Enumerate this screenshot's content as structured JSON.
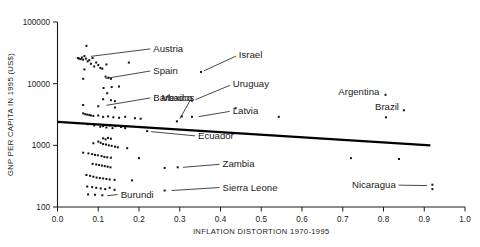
{
  "chart_data": {
    "type": "scatter",
    "title": "",
    "xlabel": "INFLATION DISTORTION 1970-1995",
    "ylabel": "GNP PER CAPITA IN 1995 (US$)",
    "yscale": "log",
    "xscale": "linear",
    "xlim": [
      0.0,
      1.0
    ],
    "ylim": [
      100,
      100000
    ],
    "grid": false,
    "legend": null,
    "xticks": [
      "0.0",
      "0.1",
      "0.2",
      "0.3",
      "0.4",
      "0.5",
      "0.6",
      "0.7",
      "0.8",
      "0.9",
      "1.0"
    ],
    "xtick_values": [
      0.0,
      0.1,
      0.2,
      0.3,
      0.4,
      0.5,
      0.6,
      0.7,
      0.8,
      0.9,
      1.0
    ],
    "yticks": [
      "100",
      "1000",
      "10000",
      "100000"
    ],
    "ytick_values": [
      100,
      1000,
      10000,
      100000
    ],
    "series": [
      {
        "name": "countries",
        "marker": "square",
        "color": "#111111",
        "points": [
          {
            "x": 0.071,
            "y": 41000
          },
          {
            "x": 0.05,
            "y": 26000
          },
          {
            "x": 0.053,
            "y": 25500
          },
          {
            "x": 0.057,
            "y": 25000
          },
          {
            "x": 0.06,
            "y": 26500
          },
          {
            "x": 0.063,
            "y": 24500
          },
          {
            "x": 0.066,
            "y": 28000
          },
          {
            "x": 0.07,
            "y": 25500
          },
          {
            "x": 0.074,
            "y": 23000
          },
          {
            "x": 0.078,
            "y": 24000
          },
          {
            "x": 0.082,
            "y": 21000
          },
          {
            "x": 0.086,
            "y": 26000
          },
          {
            "x": 0.09,
            "y": 19000
          },
          {
            "x": 0.095,
            "y": 22000
          },
          {
            "x": 0.1,
            "y": 20000
          },
          {
            "x": 0.105,
            "y": 18000
          },
          {
            "x": 0.066,
            "y": 17000
          },
          {
            "x": 0.11,
            "y": 17500
          },
          {
            "x": 0.12,
            "y": 20500
          },
          {
            "x": 0.175,
            "y": 22000
          },
          {
            "x": 0.063,
            "y": 12000
          },
          {
            "x": 0.118,
            "y": 13000
          },
          {
            "x": 0.125,
            "y": 12500
          },
          {
            "x": 0.131,
            "y": 12000
          },
          {
            "x": 0.113,
            "y": 8500
          },
          {
            "x": 0.133,
            "y": 8800
          },
          {
            "x": 0.151,
            "y": 9000
          },
          {
            "x": 0.122,
            "y": 7000
          },
          {
            "x": 0.112,
            "y": 5600
          },
          {
            "x": 0.131,
            "y": 5400
          },
          {
            "x": 0.141,
            "y": 5200
          },
          {
            "x": 0.063,
            "y": 4500
          },
          {
            "x": 0.1,
            "y": 4300
          },
          {
            "x": 0.141,
            "y": 4100
          },
          {
            "x": 0.063,
            "y": 3300
          },
          {
            "x": 0.068,
            "y": 3200
          },
          {
            "x": 0.073,
            "y": 3150
          },
          {
            "x": 0.078,
            "y": 3100
          },
          {
            "x": 0.082,
            "y": 3050
          },
          {
            "x": 0.088,
            "y": 3000
          },
          {
            "x": 0.1,
            "y": 3050
          },
          {
            "x": 0.112,
            "y": 2900
          },
          {
            "x": 0.124,
            "y": 2950
          },
          {
            "x": 0.137,
            "y": 2850
          },
          {
            "x": 0.151,
            "y": 2800
          },
          {
            "x": 0.166,
            "y": 2900
          },
          {
            "x": 0.19,
            "y": 2750
          },
          {
            "x": 0.204,
            "y": 2700
          },
          {
            "x": 0.352,
            "y": 15500
          },
          {
            "x": 0.33,
            "y": 5300
          },
          {
            "x": 0.437,
            "y": 4000
          },
          {
            "x": 0.305,
            "y": 2950
          },
          {
            "x": 0.33,
            "y": 2900
          },
          {
            "x": 0.293,
            "y": 2450
          },
          {
            "x": 0.805,
            "y": 6600
          },
          {
            "x": 0.85,
            "y": 3700
          },
          {
            "x": 0.543,
            "y": 2900
          },
          {
            "x": 0.806,
            "y": 2850
          },
          {
            "x": 0.074,
            "y": 2200
          },
          {
            "x": 0.09,
            "y": 2100
          },
          {
            "x": 0.105,
            "y": 2000
          },
          {
            "x": 0.112,
            "y": 2050
          },
          {
            "x": 0.12,
            "y": 1950
          },
          {
            "x": 0.128,
            "y": 2100
          },
          {
            "x": 0.135,
            "y": 1900
          },
          {
            "x": 0.142,
            "y": 2050
          },
          {
            "x": 0.156,
            "y": 1980
          },
          {
            "x": 0.166,
            "y": 1900
          },
          {
            "x": 0.22,
            "y": 1700
          },
          {
            "x": 0.112,
            "y": 1300
          },
          {
            "x": 0.118,
            "y": 1250
          },
          {
            "x": 0.124,
            "y": 1320
          },
          {
            "x": 0.131,
            "y": 1280
          },
          {
            "x": 0.1,
            "y": 1150
          },
          {
            "x": 0.106,
            "y": 1100
          },
          {
            "x": 0.088,
            "y": 1080
          },
          {
            "x": 0.112,
            "y": 1050
          },
          {
            "x": 0.119,
            "y": 1030
          },
          {
            "x": 0.126,
            "y": 1000
          },
          {
            "x": 0.133,
            "y": 980
          },
          {
            "x": 0.141,
            "y": 950
          },
          {
            "x": 0.148,
            "y": 930
          },
          {
            "x": 0.171,
            "y": 900
          },
          {
            "x": 0.063,
            "y": 760
          },
          {
            "x": 0.076,
            "y": 740
          },
          {
            "x": 0.085,
            "y": 720
          },
          {
            "x": 0.092,
            "y": 700
          },
          {
            "x": 0.099,
            "y": 690
          },
          {
            "x": 0.108,
            "y": 670
          },
          {
            "x": 0.115,
            "y": 650
          },
          {
            "x": 0.122,
            "y": 640
          },
          {
            "x": 0.131,
            "y": 630
          },
          {
            "x": 0.2,
            "y": 620
          },
          {
            "x": 0.72,
            "y": 620
          },
          {
            "x": 0.086,
            "y": 500
          },
          {
            "x": 0.095,
            "y": 490
          },
          {
            "x": 0.102,
            "y": 480
          },
          {
            "x": 0.109,
            "y": 470
          },
          {
            "x": 0.116,
            "y": 460
          },
          {
            "x": 0.123,
            "y": 450
          },
          {
            "x": 0.13,
            "y": 440
          },
          {
            "x": 0.263,
            "y": 430
          },
          {
            "x": 0.295,
            "y": 440
          },
          {
            "x": 0.838,
            "y": 600
          },
          {
            "x": 0.071,
            "y": 330
          },
          {
            "x": 0.08,
            "y": 320
          },
          {
            "x": 0.088,
            "y": 310
          },
          {
            "x": 0.096,
            "y": 300
          },
          {
            "x": 0.104,
            "y": 295
          },
          {
            "x": 0.112,
            "y": 290
          },
          {
            "x": 0.12,
            "y": 285
          },
          {
            "x": 0.128,
            "y": 280
          },
          {
            "x": 0.14,
            "y": 275
          },
          {
            "x": 0.183,
            "y": 270
          },
          {
            "x": 0.073,
            "y": 215
          },
          {
            "x": 0.085,
            "y": 210
          },
          {
            "x": 0.095,
            "y": 205
          },
          {
            "x": 0.106,
            "y": 200
          },
          {
            "x": 0.117,
            "y": 195
          },
          {
            "x": 0.128,
            "y": 205
          },
          {
            "x": 0.14,
            "y": 190
          },
          {
            "x": 0.075,
            "y": 160
          },
          {
            "x": 0.092,
            "y": 158
          },
          {
            "x": 0.11,
            "y": 155
          },
          {
            "x": 0.263,
            "y": 185
          },
          {
            "x": 0.92,
            "y": 230
          },
          {
            "x": 0.92,
            "y": 195
          }
        ]
      }
    ],
    "trendline": {
      "label": "fitted regression line",
      "x0": 0.0,
      "y0": 2400,
      "x1": 0.915,
      "y1": 1000
    },
    "annotations": [
      {
        "label": "Austria",
        "text_x": 0.235,
        "text_y": 33000,
        "point_x": 0.074,
        "point_y": 27500,
        "anchor": "start"
      },
      {
        "label": "Spain",
        "text_x": 0.235,
        "text_y": 14500,
        "point_x": 0.11,
        "point_y": 12000,
        "anchor": "start"
      },
      {
        "label": "Barbados",
        "text_x": 0.235,
        "text_y": 5300,
        "point_x": 0.112,
        "point_y": 4400,
        "anchor": "start"
      },
      {
        "label": "Mexico",
        "text_x": 0.33,
        "text_y": 5300,
        "point_x": 0.296,
        "point_y": 2450,
        "anchor": "end"
      },
      {
        "label": "Israel",
        "text_x": 0.445,
        "text_y": 26000,
        "point_x": 0.352,
        "point_y": 15500,
        "anchor": "start"
      },
      {
        "label": "Uruguay",
        "text_x": 0.43,
        "text_y": 8700,
        "point_x": 0.331,
        "point_y": 5300,
        "anchor": "start"
      },
      {
        "label": "Latvia",
        "text_x": 0.43,
        "text_y": 3200,
        "point_x": 0.339,
        "point_y": 2900,
        "anchor": "start"
      },
      {
        "label": "Argentina",
        "text_x": 0.79,
        "text_y": 6500,
        "point_x": 0.806,
        "point_y": 6500,
        "anchor": "end"
      },
      {
        "label": "Brazil",
        "text_x": 0.838,
        "text_y": 3700,
        "point_x": 0.851,
        "point_y": 3700,
        "anchor": "end"
      },
      {
        "label": "Ecuador",
        "text_x": 0.345,
        "text_y": 1250,
        "point_x": 0.222,
        "point_y": 1700,
        "anchor": "start"
      },
      {
        "label": "Zambia",
        "text_x": 0.405,
        "text_y": 440,
        "point_x": 0.3,
        "point_y": 440,
        "anchor": "start"
      },
      {
        "label": "Sierra Leone",
        "text_x": 0.405,
        "text_y": 185,
        "point_x": 0.272,
        "point_y": 185,
        "anchor": "start"
      },
      {
        "label": "Burundi",
        "text_x": 0.155,
        "text_y": 140,
        "point_x": 0.114,
        "point_y": 155,
        "anchor": "start"
      },
      {
        "label": "Nicaragua",
        "text_x": 0.83,
        "text_y": 200,
        "point_x": 0.915,
        "point_y": 225,
        "anchor": "end"
      }
    ]
  }
}
